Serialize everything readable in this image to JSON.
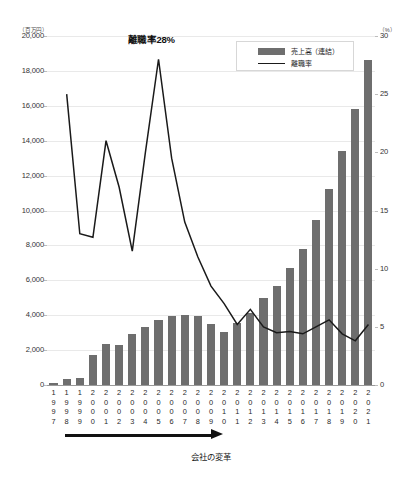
{
  "chart_data": {
    "type": "bar",
    "title": "",
    "xlabel": "会社の変革",
    "ylabel": "",
    "left_axis": {
      "unit_label": "（百万円）",
      "ticks": [
        0,
        2000,
        4000,
        6000,
        8000,
        10000,
        12000,
        14000,
        16000,
        18000,
        20000
      ],
      "tick_labels": [
        "0",
        "2,000",
        "4,000",
        "6,000",
        "8,000",
        "10,000",
        "12,000",
        "14,000",
        "16,000",
        "18,000",
        "20,000"
      ],
      "ylim": [
        0,
        20000
      ]
    },
    "right_axis": {
      "unit_label": "（%）",
      "ticks": [
        0,
        5,
        10,
        15,
        20,
        25,
        30
      ],
      "tick_labels": [
        "0",
        "5",
        "10",
        "15",
        "20",
        "25",
        "30"
      ],
      "ylim": [
        0,
        30
      ]
    },
    "grid": true,
    "legend_position": "top-right",
    "categories": [
      "1997",
      "1998",
      "1999",
      "2000",
      "2001",
      "2002",
      "2003",
      "2004",
      "2005",
      "2006",
      "2007",
      "2008",
      "2009",
      "2010",
      "2011",
      "2012",
      "2013",
      "2014",
      "2015",
      "2016",
      "2017",
      "2018",
      "2019",
      "2020",
      "2021"
    ],
    "series": [
      {
        "name": "売上高（連結）",
        "type": "bar",
        "axis": "left",
        "color": "#6e6e6e",
        "values": [
          100,
          320,
          430,
          1700,
          2350,
          2300,
          2950,
          3350,
          3700,
          3950,
          4000,
          3950,
          3500,
          3050,
          3550,
          4150,
          5000,
          5650,
          6700,
          7800,
          9450,
          11250,
          13400,
          15800,
          18600
        ]
      },
      {
        "name": "離職率",
        "type": "line",
        "axis": "right",
        "color": "#1a1a1a",
        "values": [
          null,
          25.0,
          13.0,
          12.7,
          21.0,
          17.0,
          11.5,
          20.0,
          28.0,
          19.5,
          14.0,
          11.0,
          8.5,
          7.0,
          5.2,
          6.5,
          5.0,
          4.5,
          4.6,
          4.4,
          5.0,
          5.6,
          4.4,
          3.8,
          5.2
        ]
      }
    ],
    "annotations": [
      {
        "text": "離職率28%",
        "target_category": "2005",
        "value": 28.0
      }
    ]
  },
  "legend": {
    "items": [
      {
        "label": "売上高（連結）",
        "marker": "bar-swatch"
      },
      {
        "label": "離職率",
        "marker": "line-swatch"
      }
    ]
  }
}
